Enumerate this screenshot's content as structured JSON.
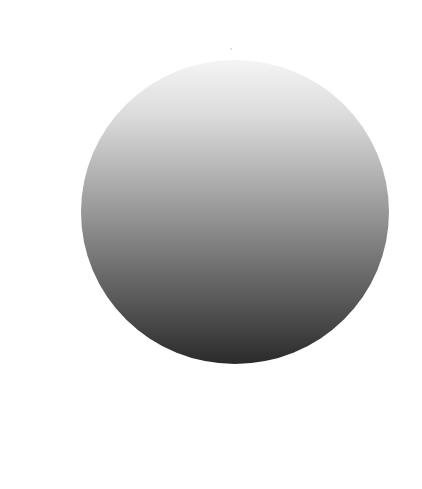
{
  "figure": {
    "shape": "circle",
    "fill": "vertical-gradient",
    "colors": {
      "background": "#ffffff",
      "gradient_top": "#f4f4f4",
      "gradient_bottom": "#2a2a2a"
    }
  }
}
